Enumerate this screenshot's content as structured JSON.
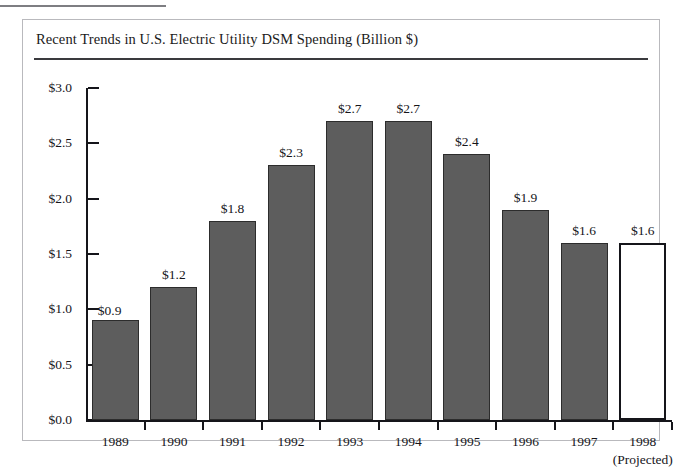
{
  "figure": {
    "title": "Recent Trends in U.S. Electric Utility DSM Spending (Billion $)"
  },
  "colors": {
    "bar_fill": "#5d5d5d",
    "bar_stroke": "#2c2c2c",
    "projected_fill": "#ffffff",
    "projected_stroke": "#15151a",
    "axis": "#15151a",
    "frame": "#b9b9bd",
    "title_rule": "#3a3a3e"
  },
  "chart_data": {
    "type": "bar",
    "title": "Recent Trends in U.S. Electric Utility DSM Spending (Billion $)",
    "xlabel": "",
    "ylabel": "",
    "ylim": [
      0.0,
      3.0
    ],
    "ytick_labels": [
      "$3.0",
      "$2.5",
      "$2.0",
      "$1.5",
      "$1.0",
      "$0.5",
      "$0.0"
    ],
    "ytick_values": [
      3.0,
      2.5,
      2.0,
      1.5,
      1.0,
      0.5,
      0.0
    ],
    "grid": false,
    "legend": false,
    "categories": [
      "1989",
      "1990",
      "1991",
      "1992",
      "1993",
      "1994",
      "1995",
      "1996",
      "1997",
      "1998"
    ],
    "category_sublabels": [
      "",
      "",
      "",
      "",
      "",
      "",
      "",
      "",
      "",
      "(Projected)"
    ],
    "values": [
      0.9,
      1.2,
      1.8,
      2.3,
      2.7,
      2.7,
      2.4,
      1.9,
      1.6,
      1.6
    ],
    "data_labels": [
      "$0.9",
      "$1.2",
      "$1.8",
      "$2.3",
      "$2.7",
      "$2.7",
      "$2.4",
      "$1.9",
      "$1.6",
      "$1.6"
    ],
    "bar_styles": [
      "filled",
      "filled",
      "filled",
      "filled",
      "filled",
      "filled",
      "filled",
      "filled",
      "filled",
      "hollow"
    ],
    "label_placement": [
      "inline-right",
      "above",
      "above",
      "above",
      "above",
      "above",
      "above",
      "above",
      "above",
      "above"
    ]
  }
}
